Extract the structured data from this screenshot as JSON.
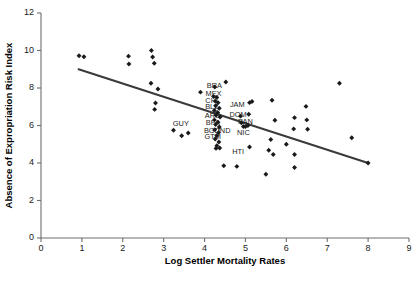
{
  "chart_data": {
    "type": "scatter",
    "title": "",
    "xlabel": "Log Settler Mortality Rates",
    "ylabel": "Absence of Expropriation Risk Index",
    "xlim": [
      0,
      9
    ],
    "ylim": [
      0,
      12
    ],
    "xticks": [
      0,
      1,
      2,
      3,
      4,
      5,
      6,
      7,
      8,
      9
    ],
    "yticks": [
      0,
      2,
      4,
      6,
      8,
      10,
      12
    ],
    "grid": false,
    "legend": null,
    "marker": "diamond",
    "marker_color": "#1a1a1a",
    "fit_line": {
      "name": "regression-line",
      "color": "#3a3a3a",
      "x_start": 0.92,
      "y_start": 9.0,
      "x_end": 8.0,
      "y_end": 4.0
    },
    "points": [
      {
        "x": 0.93,
        "y": 9.72
      },
      {
        "x": 1.05,
        "y": 9.67
      },
      {
        "x": 2.14,
        "y": 9.7
      },
      {
        "x": 2.15,
        "y": 9.28
      },
      {
        "x": 2.7,
        "y": 10.0
      },
      {
        "x": 2.73,
        "y": 9.65
      },
      {
        "x": 2.77,
        "y": 9.32
      },
      {
        "x": 2.69,
        "y": 8.25
      },
      {
        "x": 2.86,
        "y": 7.95
      },
      {
        "x": 2.8,
        "y": 7.2
      },
      {
        "x": 2.78,
        "y": 6.86
      },
      {
        "x": 3.24,
        "y": 5.75
      },
      {
        "x": 3.44,
        "y": 5.45
      },
      {
        "x": 3.6,
        "y": 5.6
      },
      {
        "x": 3.9,
        "y": 7.78
      },
      {
        "x": 4.25,
        "y": 8.05
      },
      {
        "x": 4.22,
        "y": 7.55
      },
      {
        "x": 4.3,
        "y": 7.5
      },
      {
        "x": 4.26,
        "y": 7.3
      },
      {
        "x": 4.33,
        "y": 7.22
      },
      {
        "x": 4.27,
        "y": 7.05
      },
      {
        "x": 4.36,
        "y": 6.92
      },
      {
        "x": 4.24,
        "y": 6.8
      },
      {
        "x": 4.32,
        "y": 6.7
      },
      {
        "x": 4.28,
        "y": 6.55
      },
      {
        "x": 4.38,
        "y": 6.45
      },
      {
        "x": 4.24,
        "y": 6.3
      },
      {
        "x": 4.33,
        "y": 6.18
      },
      {
        "x": 4.27,
        "y": 6.05
      },
      {
        "x": 4.36,
        "y": 5.92
      },
      {
        "x": 4.25,
        "y": 5.78
      },
      {
        "x": 4.34,
        "y": 5.62
      },
      {
        "x": 4.3,
        "y": 5.45
      },
      {
        "x": 4.26,
        "y": 5.28
      },
      {
        "x": 4.35,
        "y": 5.12
      },
      {
        "x": 4.3,
        "y": 4.92
      },
      {
        "x": 4.37,
        "y": 4.8
      },
      {
        "x": 4.28,
        "y": 4.78
      },
      {
        "x": 4.47,
        "y": 3.85
      },
      {
        "x": 4.52,
        "y": 8.32
      },
      {
        "x": 4.79,
        "y": 3.82
      },
      {
        "x": 4.88,
        "y": 6.5
      },
      {
        "x": 4.9,
        "y": 6.15
      },
      {
        "x": 4.95,
        "y": 5.95
      },
      {
        "x": 5.0,
        "y": 5.95
      },
      {
        "x": 5.06,
        "y": 6.0
      },
      {
        "x": 5.1,
        "y": 7.22
      },
      {
        "x": 5.16,
        "y": 7.28
      },
      {
        "x": 5.08,
        "y": 6.6
      },
      {
        "x": 5.1,
        "y": 4.85
      },
      {
        "x": 5.5,
        "y": 3.4
      },
      {
        "x": 5.57,
        "y": 4.68
      },
      {
        "x": 5.62,
        "y": 5.25
      },
      {
        "x": 5.65,
        "y": 7.35
      },
      {
        "x": 5.68,
        "y": 4.45
      },
      {
        "x": 5.72,
        "y": 6.28
      },
      {
        "x": 6.0,
        "y": 5.0
      },
      {
        "x": 6.18,
        "y": 5.82
      },
      {
        "x": 6.2,
        "y": 6.42
      },
      {
        "x": 6.2,
        "y": 4.45
      },
      {
        "x": 6.2,
        "y": 3.76
      },
      {
        "x": 6.48,
        "y": 7.02
      },
      {
        "x": 6.5,
        "y": 6.3
      },
      {
        "x": 6.52,
        "y": 5.8
      },
      {
        "x": 7.3,
        "y": 8.25
      },
      {
        "x": 7.6,
        "y": 5.35
      },
      {
        "x": 8.0,
        "y": 4.0
      }
    ],
    "point_labels": [
      {
        "text": "BRA",
        "x": 4.24,
        "y": 8.1
      },
      {
        "text": "MEX",
        "x": 4.22,
        "y": 7.68
      },
      {
        "text": "CHL",
        "x": 4.2,
        "y": 7.3
      },
      {
        "text": "BLZ",
        "x": 4.18,
        "y": 7.0
      },
      {
        "text": "JAM",
        "x": 4.8,
        "y": 7.1
      },
      {
        "text": "ARG",
        "x": 4.2,
        "y": 6.52
      },
      {
        "text": "DOM",
        "x": 4.82,
        "y": 6.55
      },
      {
        "text": "BFA",
        "x": 4.2,
        "y": 6.12
      },
      {
        "text": "PAN",
        "x": 5.0,
        "y": 6.18
      },
      {
        "text": "GUY",
        "x": 3.42,
        "y": 6.1
      },
      {
        "text": "BGD",
        "x": 4.18,
        "y": 5.72
      },
      {
        "text": "IND",
        "x": 4.48,
        "y": 5.72
      },
      {
        "text": "NIC",
        "x": 4.95,
        "y": 5.6
      },
      {
        "text": "GTM",
        "x": 4.2,
        "y": 5.38
      },
      {
        "text": "HTI",
        "x": 4.82,
        "y": 4.58
      }
    ]
  },
  "axes": {
    "x_title": "Log Settler Mortality Rates",
    "y_title": "Absence of Expropriation Risk Index"
  }
}
